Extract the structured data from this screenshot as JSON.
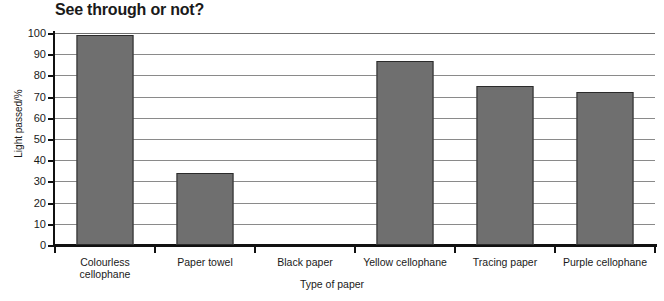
{
  "chart_data": {
    "type": "bar",
    "title": "See through or not?",
    "xlabel": "Type of paper",
    "ylabel": "Light passed/%",
    "categories": [
      "Colourless cellophane",
      "Paper towel",
      "Black paper",
      "Yellow cellophane",
      "Tracing paper",
      "Purple cellophane"
    ],
    "category_lines": [
      [
        "Colourless",
        "cellophane"
      ],
      [
        "Paper towel"
      ],
      [
        "Black paper"
      ],
      [
        "Yellow cellophane"
      ],
      [
        "Tracing paper"
      ],
      [
        "Purple cellophane"
      ]
    ],
    "values": [
      99,
      34,
      0,
      87,
      75,
      72
    ],
    "ylim": [
      0,
      100
    ],
    "ytick_step": 10,
    "ytick_labels": [
      "100",
      "90",
      "80",
      "70",
      "60",
      "50",
      "40",
      "30",
      "20",
      "10",
      "0"
    ],
    "grid": true,
    "legend": false,
    "bar_fill": "#6f6f6f",
    "bar_outline": "#2b2b2b",
    "grid_color": "#8a8a8a",
    "axis_color": "#111111"
  }
}
